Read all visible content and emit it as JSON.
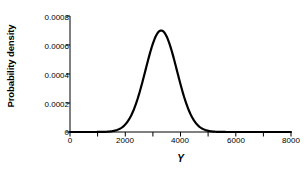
{
  "chart_data": {
    "type": "line",
    "title": "",
    "xlabel": "Y",
    "ylabel": "Probability density",
    "xlim": [
      0,
      8000
    ],
    "ylim": [
      0,
      0.0008
    ],
    "grid": false,
    "legend": null,
    "xticks": [
      {
        "value": 0,
        "label": "0",
        "major": true
      },
      {
        "value": 1000,
        "label": "",
        "major": false
      },
      {
        "value": 2000,
        "label": "2000",
        "major": true
      },
      {
        "value": 3000,
        "label": "",
        "major": false
      },
      {
        "value": 4000,
        "label": "4000",
        "major": true
      },
      {
        "value": 5000,
        "label": "",
        "major": false
      },
      {
        "value": 6000,
        "label": "6000",
        "major": true
      },
      {
        "value": 7000,
        "label": "",
        "major": false
      },
      {
        "value": 8000,
        "label": "8000",
        "major": true
      }
    ],
    "yticks": [
      {
        "value": 0,
        "label": "0"
      },
      {
        "value": 0.0002,
        "label": "0.0002"
      },
      {
        "value": 0.0004,
        "label": "0.0004"
      },
      {
        "value": 0.0006,
        "label": "0.0006"
      },
      {
        "value": 0.0008,
        "label": "0.0008"
      }
    ],
    "distribution": {
      "family": "normal",
      "mean": 3300,
      "sd": 570,
      "peak_density": 0.0007
    },
    "series": [
      {
        "name": "Probability density",
        "color": "#000000",
        "line_width": 2.2,
        "x": [
          0,
          200,
          400,
          600,
          800,
          1000,
          1200,
          1400,
          1500,
          1600,
          1700,
          1800,
          1900,
          2000,
          2100,
          2200,
          2300,
          2400,
          2500,
          2600,
          2700,
          2800,
          2900,
          3000,
          3100,
          3200,
          3300,
          3400,
          3500,
          3600,
          3700,
          3800,
          3900,
          4000,
          4100,
          4200,
          4300,
          4400,
          4500,
          4600,
          4700,
          4800,
          4900,
          5000,
          5200,
          5400,
          5600,
          5800,
          6000,
          6400,
          6800,
          7200,
          7600,
          8000
        ],
        "y": [
          0.0,
          0.0,
          0.0,
          0.0,
          0.0,
          0.0,
          1e-07,
          7e-07,
          1.6e-06,
          3.3e-06,
          6.5e-06,
          1.21e-05,
          2.13e-05,
          3.56e-05,
          5.66e-05,
          8.54e-05,
          0.0001227,
          0.0001678,
          0.0002187,
          0.0002714,
          0.0003215,
          0.0003641,
          0.000395,
          0.000412,
          0.0006,
          0.00068,
          0.0006997,
          0.0006905,
          0.0006532,
          0.0005925,
          0.0005158,
          0.0004315,
          0.0003472,
          0.0002686,
          0.0001995,
          0.0001424,
          9.78e-05,
          6.45e-05,
          4.09e-05,
          2.49e-05,
          1.46e-05,
          8.2e-06,
          4.5e-06,
          2.3e-06,
          6e-07,
          1e-07,
          0.0,
          0.0,
          0.0,
          0.0,
          0.0,
          0.0,
          0.0,
          0.0
        ]
      }
    ]
  },
  "figure": {
    "background_color": "#ffffff",
    "axis_color": "#000000",
    "curve_color": "#000000"
  }
}
